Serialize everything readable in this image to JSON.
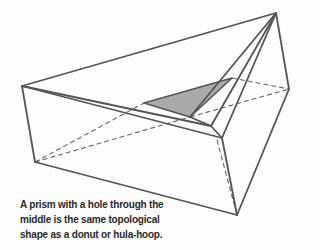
{
  "figure": {
    "subject": "prism with a hole through the middle",
    "colors": {
      "edge": "#555555",
      "hidden_edge": "#666666",
      "hole_fill": "#aaaaaa",
      "background": "#fdfdfd",
      "caption": "#2a2a2a"
    }
  },
  "caption": {
    "lines": [
      "A prism with a hole through the",
      "middle is the same topological",
      "shape as a donut or hula-hoop."
    ]
  }
}
